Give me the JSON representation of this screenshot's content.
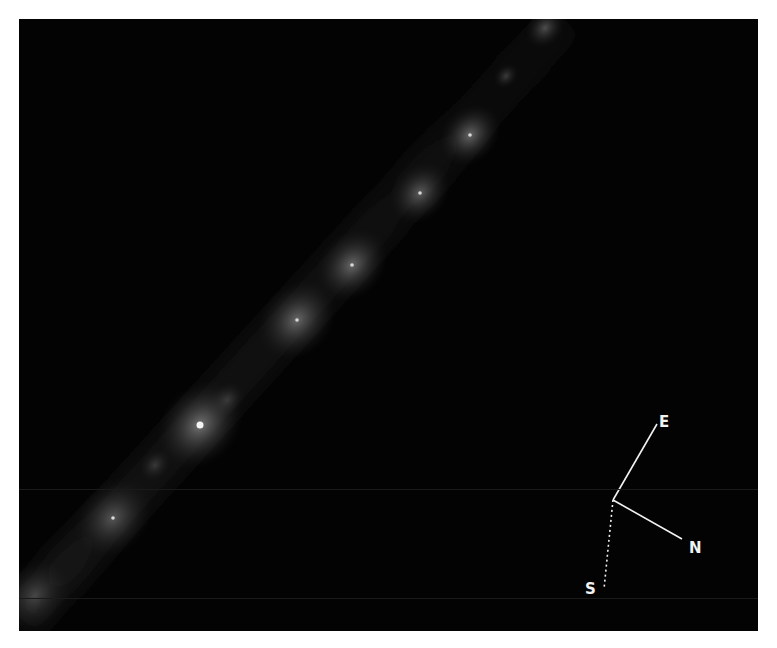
{
  "image": {
    "subject": "comet fragment train",
    "background_color": "#030303",
    "frame_color": "#ffffff"
  },
  "compass": {
    "labels": {
      "east": "E",
      "north": "N",
      "south": "S"
    },
    "line_color": "#f2f2f2"
  },
  "fragments": [
    {
      "x": 526,
      "y": 9,
      "r": 22,
      "brightness": 0.22,
      "nucleus": false
    },
    {
      "x": 487,
      "y": 57,
      "r": 14,
      "brightness": 0.16,
      "nucleus": false
    },
    {
      "x": 451,
      "y": 116,
      "r": 34,
      "brightness": 0.3,
      "nucleus": true
    },
    {
      "x": 401,
      "y": 174,
      "r": 34,
      "brightness": 0.26,
      "nucleus": true
    },
    {
      "x": 333,
      "y": 246,
      "r": 40,
      "brightness": 0.3,
      "nucleus": true
    },
    {
      "x": 278,
      "y": 301,
      "r": 44,
      "brightness": 0.3,
      "nucleus": true
    },
    {
      "x": 208,
      "y": 381,
      "r": 20,
      "brightness": 0.16,
      "nucleus": false
    },
    {
      "x": 181,
      "y": 406,
      "r": 48,
      "brightness": 0.34,
      "nucleus": true,
      "bright": true
    },
    {
      "x": 136,
      "y": 446,
      "r": 18,
      "brightness": 0.14,
      "nucleus": false
    },
    {
      "x": 94,
      "y": 499,
      "r": 44,
      "brightness": 0.24,
      "nucleus": true
    },
    {
      "x": 16,
      "y": 576,
      "r": 40,
      "brightness": 0.18,
      "nucleus": false
    }
  ]
}
